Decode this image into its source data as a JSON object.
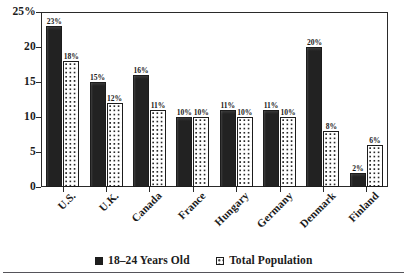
{
  "chart_data": {
    "type": "bar",
    "title": "",
    "subtitle": "",
    "xlabel": "",
    "ylabel": "",
    "ylim": [
      0,
      25
    ],
    "grid": false,
    "legend_position": "bottom",
    "categories": [
      "U.S.",
      "U.K.",
      "Canada",
      "France",
      "Hungary",
      "Germany",
      "Denmark",
      "Finland"
    ],
    "y_ticks": [
      "0",
      "5",
      "10",
      "15",
      "20",
      "25%"
    ],
    "y_tick_values": [
      0,
      5,
      10,
      15,
      20,
      25
    ],
    "series": [
      {
        "name": "18–24 Years Old",
        "marker": "solid-black-square",
        "values": [
          23,
          15,
          16,
          10,
          11,
          11,
          20,
          2
        ],
        "labels": [
          "23%",
          "15%",
          "16%",
          "10%",
          "11%",
          "11%",
          "20%",
          "2%"
        ]
      },
      {
        "name": "Total Population",
        "marker": "dotted-white-square",
        "values": [
          18,
          12,
          11,
          10,
          10,
          10,
          8,
          6
        ],
        "labels": [
          "18%",
          "12%",
          "11%",
          "10%",
          "10%",
          "10%",
          "8%",
          "6%"
        ]
      }
    ]
  },
  "legend": {
    "items": [
      {
        "label": "18–24 Years Old",
        "swatch": "solid-black-square"
      },
      {
        "label": "Total Population",
        "swatch": "dotted-white-square"
      }
    ]
  }
}
